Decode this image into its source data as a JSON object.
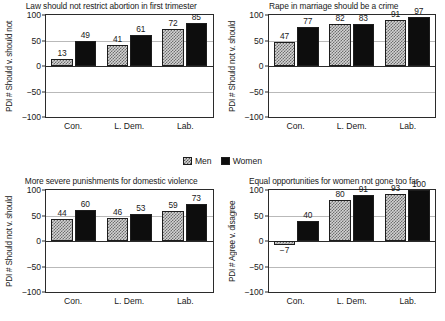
{
  "legend": {
    "position": "center-between-rows",
    "entries": [
      {
        "label": "Men",
        "swatch": "checkered-gray",
        "color": "#d3d3d3"
      },
      {
        "label": "Women",
        "swatch": "solid-black",
        "color": "#0d0d0d"
      }
    ]
  },
  "axis": {
    "ticks": [
      "100",
      "50",
      "0",
      "-50",
      "-100"
    ],
    "tick_values": [
      100,
      50,
      0,
      -50,
      -100
    ],
    "ylim": [
      -100,
      100
    ],
    "categories": [
      "Con.",
      "L. Dem.",
      "Lab."
    ]
  },
  "chart_data": [
    {
      "type": "bar",
      "title": "Law should not restrict abortion in first trimester",
      "ylabel": "PDI # Should v. should not",
      "xlabel": "",
      "categories": [
        "Con.",
        "L. Dem.",
        "Lab."
      ],
      "series": [
        {
          "name": "Men",
          "values": [
            13,
            41,
            72
          ]
        },
        {
          "name": "Women",
          "values": [
            49,
            61,
            85
          ]
        }
      ],
      "ylim": [
        -100,
        100
      ],
      "grid": true
    },
    {
      "type": "bar",
      "title": "Rape in marriage should be a crime",
      "ylabel": "PDI # Should not v. should",
      "xlabel": "",
      "categories": [
        "Con.",
        "L. Dem.",
        "Lab."
      ],
      "series": [
        {
          "name": "Men",
          "values": [
            47,
            82,
            91
          ]
        },
        {
          "name": "Women",
          "values": [
            77,
            83,
            97
          ]
        }
      ],
      "ylim": [
        -100,
        100
      ],
      "grid": true
    },
    {
      "type": "bar",
      "title": "More severe punishments for domestic violence",
      "ylabel": "PDI # Should not v. should",
      "xlabel": "",
      "categories": [
        "Con.",
        "L. Dem.",
        "Lab."
      ],
      "series": [
        {
          "name": "Men",
          "values": [
            44,
            46,
            59
          ]
        },
        {
          "name": "Women",
          "values": [
            60,
            53,
            73
          ]
        }
      ],
      "ylim": [
        -100,
        100
      ],
      "grid": true
    },
    {
      "type": "bar",
      "title": "Equal opportunities for women not gone too far",
      "ylabel": "PDI # Agree v. disagree",
      "xlabel": "",
      "categories": [
        "Con.",
        "L. Dem.",
        "Lab."
      ],
      "series": [
        {
          "name": "Men",
          "values": [
            -7,
            80,
            93
          ]
        },
        {
          "name": "Women",
          "values": [
            40,
            91,
            100
          ]
        }
      ],
      "value_labels": {
        "men": [
          "-7",
          "80",
          "93"
        ],
        "women": [
          "40",
          "91",
          "100"
        ]
      },
      "ylim": [
        -100,
        100
      ],
      "grid": true
    }
  ]
}
